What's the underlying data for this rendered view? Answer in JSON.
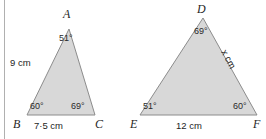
{
  "figure": {
    "background_color": "#ffffff",
    "triangle_fill": "#d8d8d8",
    "triangle_stroke": "#8c8c8c",
    "rule_color": "#b0b0b0"
  },
  "triangle_left": {
    "name": "ABC",
    "vertices": {
      "apex": "A",
      "bottom_left": "B",
      "bottom_right": "C"
    },
    "angles": {
      "apex": "51°",
      "bottom_left": "60°",
      "bottom_right": "69°"
    },
    "sides": {
      "left": "9 cm",
      "bottom": "7·5 cm"
    }
  },
  "triangle_right": {
    "name": "DEF",
    "vertices": {
      "apex": "D",
      "bottom_left": "E",
      "bottom_right": "F"
    },
    "angles": {
      "apex": "69°",
      "bottom_left": "51°",
      "bottom_right": "60°"
    },
    "sides": {
      "right": "x cm",
      "bottom": "12 cm"
    }
  }
}
